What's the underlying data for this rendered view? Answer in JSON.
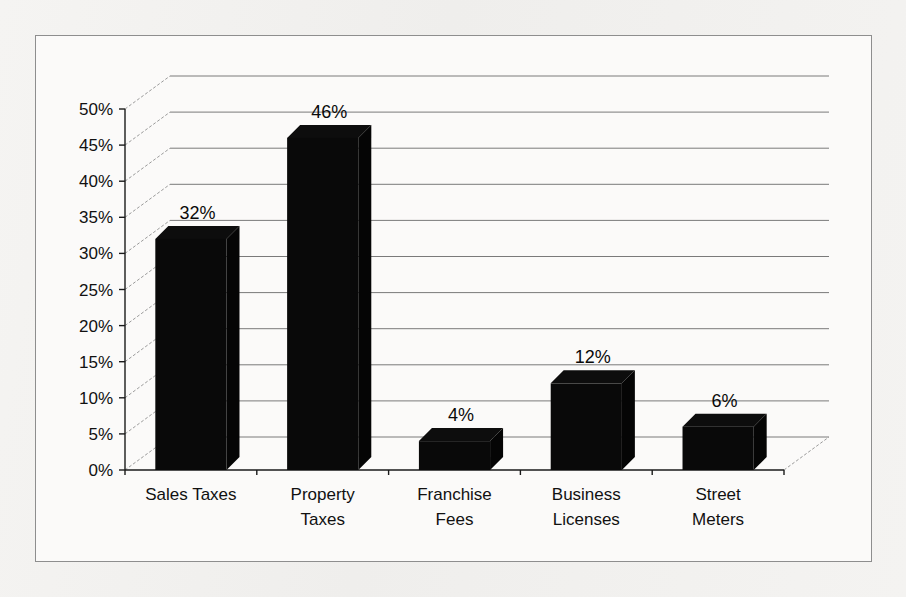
{
  "chart_data": {
    "type": "bar",
    "title": "",
    "subtitle": "",
    "xlabel": "",
    "ylabel": "",
    "categories": [
      "Sales Taxes",
      "Property Taxes",
      "Franchise Fees",
      "Business Licenses",
      "Street Meters"
    ],
    "values": [
      32,
      46,
      4,
      12,
      6
    ],
    "value_labels": [
      "32%",
      "46%",
      "4%",
      "12%",
      "6%"
    ],
    "ylim": [
      0,
      50
    ],
    "ytick_values": [
      0,
      5,
      10,
      15,
      20,
      25,
      30,
      35,
      40,
      45,
      50
    ],
    "ytick_labels": [
      "0%",
      "5%",
      "10%",
      "15%",
      "20%",
      "25%",
      "30%",
      "35%",
      "40%",
      "45%",
      "50%"
    ],
    "grid": true,
    "legend": false,
    "legend_position": "none",
    "style": "3d-column",
    "series": [
      {
        "name": "Revenue Share",
        "values": [
          32,
          46,
          4,
          12,
          6
        ]
      }
    ],
    "annotations": [],
    "colors": {
      "bar": "#090909",
      "bar_top": "#0d0d0d",
      "bar_side": "#050505",
      "gridline": "#7a7a7a",
      "axis": "#1a1a1a",
      "plot_background": "#fbfaf9",
      "page_background": "#f2f1ef",
      "frame_border": "#8e8e8e",
      "text": "#111111"
    }
  },
  "category_lines": [
    [
      "Sales Taxes"
    ],
    [
      "Property",
      "Taxes"
    ],
    [
      "Franchise",
      "Fees"
    ],
    [
      "Business",
      "Licenses"
    ],
    [
      "Street",
      "Meters"
    ]
  ]
}
